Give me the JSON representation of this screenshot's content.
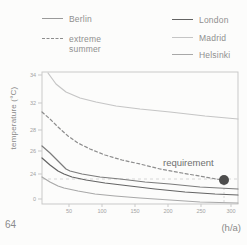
{
  "page_number": "64",
  "legend": {
    "berlin": {
      "label": "Berlin",
      "color": "#9a9a9a"
    },
    "extreme": {
      "line1": "extreme",
      "line2": "summer",
      "color": "#8d8d8d"
    },
    "london": {
      "label": "London",
      "color": "#636363"
    },
    "madrid": {
      "label": "Madrid",
      "color": "#c5c5c5"
    },
    "helsinki": {
      "label": "Helsinki",
      "color": "#a8a8a8"
    }
  },
  "chart_data": {
    "type": "line",
    "title": "",
    "xlabel": "(h/a)",
    "ylabel": "temperature (°C)",
    "x_ticks": [
      50,
      100,
      150,
      200,
      250,
      300
    ],
    "y_ticks": [
      34,
      32,
      28,
      26,
      24,
      0
    ],
    "xlim": [
      0,
      310
    ],
    "legend_position": "top",
    "grid": false,
    "annotation": {
      "label": "requirement",
      "x": 290,
      "y": 24
    },
    "series": [
      {
        "key": "madrid",
        "name": "Madrid",
        "color": "#c5c5c5",
        "dash": "",
        "points": [
          [
            20,
            34.0
          ],
          [
            50,
            32.2
          ],
          [
            100,
            31.2
          ],
          [
            150,
            30.7
          ],
          [
            200,
            30.2
          ],
          [
            250,
            29.9
          ],
          [
            300,
            29.6
          ]
        ]
      },
      {
        "key": "extreme",
        "name": "extreme summer",
        "color": "#8d8d8d",
        "dash": "3 2.5",
        "points": [
          [
            10,
            30.2
          ],
          [
            50,
            27.8
          ],
          [
            100,
            26.1
          ],
          [
            150,
            25.1
          ],
          [
            200,
            24.5
          ],
          [
            250,
            24.1
          ],
          [
            290,
            23.9
          ]
        ]
      },
      {
        "key": "berlin",
        "name": "Berlin",
        "color": "#7b7b7b",
        "dash": "",
        "points": [
          [
            10,
            26.8
          ],
          [
            30,
            25.5
          ],
          [
            50,
            24.3
          ],
          [
            100,
            23.7
          ],
          [
            150,
            23.2
          ],
          [
            200,
            22.9
          ],
          [
            250,
            22.7
          ],
          [
            300,
            22.5
          ]
        ]
      },
      {
        "key": "london",
        "name": "London",
        "color": "#646464",
        "dash": "",
        "points": [
          [
            10,
            25.6
          ],
          [
            30,
            24.8
          ],
          [
            50,
            24.1
          ],
          [
            100,
            23.2
          ],
          [
            150,
            22.6
          ],
          [
            200,
            22.3
          ],
          [
            250,
            22.1
          ],
          [
            300,
            21.9
          ]
        ]
      },
      {
        "key": "helsinki",
        "name": "Helsinki",
        "color": "#a8a8a8",
        "dash": "",
        "points": [
          [
            10,
            23.7
          ],
          [
            30,
            23.1
          ],
          [
            50,
            22.6
          ],
          [
            100,
            22.0
          ],
          [
            150,
            21.7
          ],
          [
            200,
            21.4
          ],
          [
            250,
            21.2
          ],
          [
            300,
            21.1
          ]
        ]
      }
    ],
    "render": {
      "plot": {
        "left": 42,
        "top": 72,
        "right": 238,
        "bottom": 204
      },
      "x_tick_px": [
        69,
        102,
        135,
        168,
        201,
        231
      ],
      "y_tick_px": [
        75,
        103,
        130,
        151,
        174,
        199
      ],
      "paths": {
        "madrid": [
          [
            48,
            73
          ],
          [
            56,
            84
          ],
          [
            66,
            92
          ],
          [
            80,
            98
          ],
          [
            96,
            102
          ],
          [
            116,
            106
          ],
          [
            140,
            109
          ],
          [
            170,
            112
          ],
          [
            205,
            116
          ],
          [
            238,
            119
          ]
        ],
        "extreme": [
          [
            42,
            112
          ],
          [
            50,
            119
          ],
          [
            58,
            127
          ],
          [
            68,
            136
          ],
          [
            78,
            143
          ],
          [
            90,
            149
          ],
          [
            105,
            155
          ],
          [
            122,
            160
          ],
          [
            140,
            164
          ],
          [
            160,
            169
          ],
          [
            182,
            173
          ],
          [
            205,
            177
          ],
          [
            222,
            180
          ]
        ],
        "berlin": [
          [
            42,
            146
          ],
          [
            50,
            153
          ],
          [
            58,
            161
          ],
          [
            66,
            169
          ],
          [
            70,
            171
          ],
          [
            82,
            174
          ],
          [
            100,
            177
          ],
          [
            120,
            179
          ],
          [
            145,
            182
          ],
          [
            170,
            184
          ],
          [
            200,
            187
          ],
          [
            238,
            189
          ]
        ],
        "london": [
          [
            42,
            158
          ],
          [
            50,
            165
          ],
          [
            58,
            171
          ],
          [
            64,
            174
          ],
          [
            72,
            177
          ],
          [
            86,
            180
          ],
          [
            105,
            183
          ],
          [
            130,
            186
          ],
          [
            155,
            189
          ],
          [
            185,
            192
          ],
          [
            215,
            194
          ],
          [
            238,
            195
          ]
        ],
        "helsinki": [
          [
            42,
            177
          ],
          [
            50,
            182
          ],
          [
            58,
            186
          ],
          [
            64,
            188
          ],
          [
            78,
            191
          ],
          [
            95,
            194
          ],
          [
            115,
            196
          ],
          [
            140,
            198
          ],
          [
            170,
            200
          ],
          [
            200,
            202
          ],
          [
            238,
            203
          ]
        ]
      },
      "requirement_y": 179,
      "dot": {
        "cx": 224,
        "cy": 180,
        "r": 5,
        "color": "#4d4d4d"
      },
      "drop_x": 224,
      "req_label_pos": [
        163,
        166
      ],
      "axis_color": "#c9c9c9",
      "tick_label_color": "#a3a3a3",
      "req_line_color": "#d6d6d6"
    }
  }
}
